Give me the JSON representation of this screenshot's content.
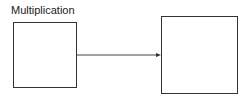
{
  "diagram": {
    "label": "Multiplication",
    "nodes": [
      {
        "id": "left",
        "label": ""
      },
      {
        "id": "right",
        "label": ""
      }
    ],
    "edges": [
      {
        "from": "left",
        "to": "right",
        "type": "arrow"
      }
    ]
  }
}
